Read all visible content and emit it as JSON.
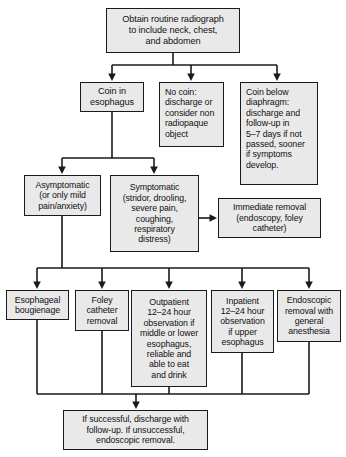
{
  "chart_data": {
    "type": "diagram",
    "nodes": [
      {
        "id": "n1",
        "label": "Obtain routine radiograph\nto include neck, chest,\nand abdomen",
        "x": 106,
        "y": 8,
        "w": 134,
        "h": 45,
        "align": "center",
        "font_size": 9.2
      },
      {
        "id": "n2",
        "label": "Coin in\nesophagus",
        "x": 80,
        "y": 82,
        "w": 64,
        "h": 30,
        "align": "center",
        "font_size": 9.2
      },
      {
        "id": "n3",
        "label": "No coin:\ndischarge or\nconsider non\nradiopaque\nobject",
        "x": 159,
        "y": 82,
        "w": 65,
        "h": 65,
        "align": "left",
        "font_size": 8.8
      },
      {
        "id": "n4",
        "label": "Coin below\ndiaphragm:\ndischarge and\nfollow-up in\n5–7 days if not\npassed, sooner\nif symptoms\ndevelop.",
        "x": 240,
        "y": 82,
        "w": 78,
        "h": 103,
        "align": "left",
        "font_size": 8.8
      },
      {
        "id": "n5",
        "label": "Asymptomatic\n(or only mild\npain/anxiety)",
        "x": 24,
        "y": 175,
        "w": 77,
        "h": 41,
        "align": "center",
        "font_size": 8.8
      },
      {
        "id": "n6",
        "label": "Symptomatic\n(stridor, drooling,\nsevere pain,\ncoughing,\nrespiratory\ndistress)",
        "x": 110,
        "y": 175,
        "w": 89,
        "h": 77,
        "align": "center",
        "font_size": 8.8
      },
      {
        "id": "n7",
        "label": "Immediate removal\n(endoscopy, foley\ncatheter)",
        "x": 218,
        "y": 198,
        "w": 103,
        "h": 40,
        "align": "center",
        "font_size": 8.8
      },
      {
        "id": "n8",
        "label": "Esophageal\nbougienage",
        "x": 6,
        "y": 290,
        "w": 63,
        "h": 30,
        "align": "center",
        "font_size": 8.8
      },
      {
        "id": "n9",
        "label": "Foley\ncatheter\nremoval",
        "x": 75,
        "y": 290,
        "w": 54,
        "h": 41,
        "align": "center",
        "font_size": 8.8
      },
      {
        "id": "n10",
        "label": "Outpatient\n12–24 hour\nobservation if\nmiddle or lower\nesophagus,\nreliable and\nable to eat\nand drink",
        "x": 131,
        "y": 290,
        "w": 76,
        "h": 97,
        "align": "center",
        "font_size": 8.8
      },
      {
        "id": "n11",
        "label": "Inpatient\n12–24 hour\nobservation\nif upper\nesophagus",
        "x": 211,
        "y": 290,
        "w": 63,
        "h": 63,
        "align": "center",
        "font_size": 8.8
      },
      {
        "id": "n12",
        "label": "Endoscopic\nremoval with\ngeneral\nanesthesia",
        "x": 277,
        "y": 290,
        "w": 64,
        "h": 52,
        "align": "center",
        "font_size": 8.8
      },
      {
        "id": "n13",
        "label": "If successful, discharge with\nfollow-up. If unsuccessful,\nendoscopic removal.",
        "x": 63,
        "y": 410,
        "w": 145,
        "h": 40,
        "align": "center",
        "font_size": 8.8
      }
    ],
    "edges": [
      {
        "from": "n1",
        "to": "n2",
        "style": "elbow-down"
      },
      {
        "from": "n1",
        "to": "n3",
        "style": "straight-down"
      },
      {
        "from": "n1",
        "to": "n4",
        "style": "elbow-down"
      },
      {
        "from": "n2",
        "to": "n5",
        "style": "elbow-down"
      },
      {
        "from": "n2",
        "to": "n6",
        "style": "elbow-down"
      },
      {
        "from": "n6",
        "to": "n7",
        "style": "straight-right"
      },
      {
        "from": "n5",
        "to": "n8",
        "style": "elbow-down"
      },
      {
        "from": "n5",
        "to": "n9",
        "style": "elbow-down"
      },
      {
        "from": "n5",
        "to": "n10",
        "style": "elbow-down"
      },
      {
        "from": "n5",
        "to": "n11",
        "style": "elbow-down"
      },
      {
        "from": "n5",
        "to": "n12",
        "style": "elbow-down"
      },
      {
        "from": "n8",
        "to": "n13",
        "style": "elbow-join"
      },
      {
        "from": "n9",
        "to": "n13",
        "style": "elbow-join"
      },
      {
        "from": "n10",
        "to": "n13",
        "style": "elbow-join"
      },
      {
        "from": "n11",
        "to": "n13",
        "style": "elbow-join"
      },
      {
        "from": "n12",
        "to": "n13",
        "style": "elbow-join"
      }
    ],
    "colors": {
      "node_fill": "#e9e9e9",
      "node_border": "#1a1a1a",
      "edge": "#1a1a1a",
      "text": "#111111",
      "background": "#ffffff"
    }
  }
}
